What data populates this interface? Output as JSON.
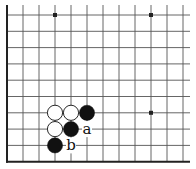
{
  "diagram": {
    "type": "go-board-fragment",
    "corner": "bottom-left",
    "columns": 12,
    "rows": 10,
    "star_points": [
      [
        3,
        0
      ],
      [
        9,
        0
      ],
      [
        9,
        6
      ]
    ],
    "stones": [
      {
        "color": "white",
        "col": 3,
        "row": 6
      },
      {
        "color": "white",
        "col": 4,
        "row": 6
      },
      {
        "color": "black",
        "col": 5,
        "row": 6
      },
      {
        "color": "white",
        "col": 3,
        "row": 7
      },
      {
        "color": "black",
        "col": 4,
        "row": 7
      },
      {
        "color": "black",
        "col": 3,
        "row": 8
      }
    ],
    "labels": [
      {
        "text": "a",
        "col": 5,
        "row": 7
      },
      {
        "text": "b",
        "col": 4,
        "row": 8
      }
    ],
    "colors": {
      "line": "#555555",
      "edge": "#222222",
      "black_stone": "#111111",
      "white_stone": "#ffffff"
    }
  }
}
